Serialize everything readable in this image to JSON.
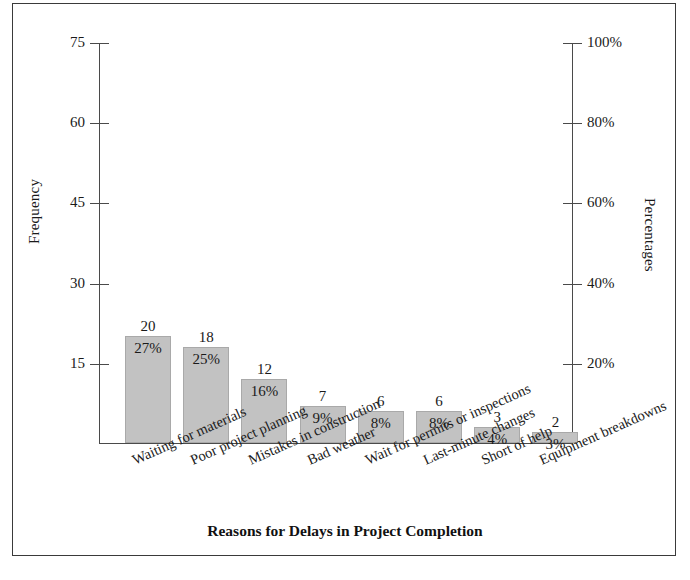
{
  "chart_data": {
    "type": "bar",
    "title": "",
    "xlabel": "Reasons for Delays in Project Completion",
    "ylabel": "Frequency",
    "ylabel_secondary": "Percentages",
    "categories": [
      "Waiting for materials",
      "Poor project planning",
      "Mistakes in construction",
      "Bad weather",
      "Wait for permits or inspections",
      "Last-minute changes",
      "Short of help",
      "Equipment breakdowns"
    ],
    "values": [
      20,
      18,
      12,
      7,
      6,
      6,
      3,
      2
    ],
    "value_labels": [
      "20",
      "18",
      "12",
      "7",
      "6",
      "6",
      "3",
      "2"
    ],
    "percent_values": [
      27,
      25,
      16,
      9,
      8,
      8,
      4,
      3
    ],
    "percent_labels": [
      "27%",
      "25%",
      "16%",
      "9%",
      "8%",
      "8%",
      "4%",
      "3%"
    ],
    "ylim": [
      0,
      75
    ],
    "ylim_secondary": [
      0,
      100
    ],
    "yticks": [
      15,
      30,
      45,
      60,
      75
    ],
    "ytick_labels": [
      "15",
      "30",
      "45",
      "60",
      "75"
    ],
    "yticks_secondary": [
      20,
      40,
      60,
      80,
      100
    ],
    "ytick_labels_secondary": [
      "20%",
      "40%",
      "60%",
      "80%",
      "100%"
    ],
    "grid": false,
    "legend": false,
    "bar_color": "#c2c2c2",
    "bar_edge_color": "#a9a9a9",
    "axis_color": "#4a4a4a",
    "text_color": "#1a1a1a",
    "background": "#ffffff"
  }
}
